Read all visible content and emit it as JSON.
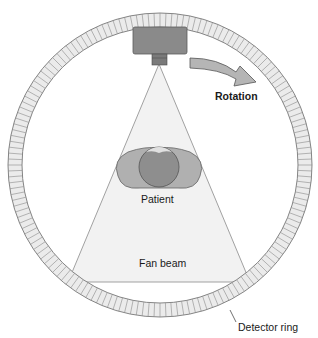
{
  "diagram": {
    "labels": {
      "rotation": "Rotation",
      "patient": "Patient",
      "fan_beam": "Fan beam",
      "detector_ring": "Detector ring"
    },
    "components": {
      "xray_tube": {
        "color": "#8a8a8a"
      },
      "collimator": {
        "color": "#7a7a7a"
      },
      "rotation_arrow": {
        "color": "#b5b5b5"
      },
      "detector_ring": {
        "fill": "#ececec",
        "stroke": "#777777",
        "segments": 160
      },
      "fan_beam": {
        "fill": "#f1f1f1",
        "stroke": "#8a8a8a"
      },
      "patient": {
        "skin": "#a8a8a8",
        "head": "#8e8e8e"
      }
    }
  }
}
